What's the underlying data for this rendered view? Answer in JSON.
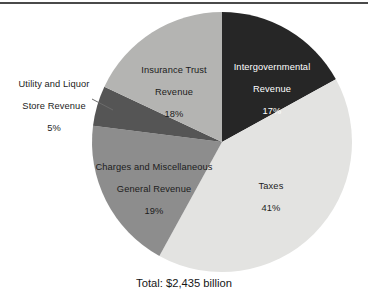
{
  "figure": {
    "caption": "Total: $2,435 billion",
    "top_rule": true
  },
  "chart_data": {
    "type": "pie",
    "title": "",
    "xlabel": "",
    "ylabel": "",
    "legend_position": "none",
    "grid": false,
    "caption": "Total: $2,435 billion",
    "total_label": "Total: $2,435 billion",
    "total_value": 2435,
    "total_units": "billion dollars",
    "start_angle_deg": 0,
    "direction": "clockwise",
    "categories": [
      "Intergovernmental Revenue",
      "Taxes",
      "Charges and Miscellaneous General Revenue",
      "Utility and Liquor Store Revenue",
      "Insurance Trust Revenue"
    ],
    "values": [
      17,
      41,
      19,
      5,
      18
    ],
    "slices": [
      {
        "name": "Intergovernmental Revenue",
        "label_line1": "Intergovernmental",
        "label_line2": "Revenue",
        "percent_text": "17%",
        "value": 17,
        "color": "#262626",
        "text_color": "#ffffff",
        "label_placement": "inside",
        "start_deg": 0,
        "end_deg": 61.2
      },
      {
        "name": "Taxes",
        "label_line1": "Taxes",
        "label_line2": "",
        "percent_text": "41%",
        "value": 41,
        "color": "#e3e3e1",
        "text_color": "#1c1c1c",
        "label_placement": "inside",
        "start_deg": 61.2,
        "end_deg": 208.8
      },
      {
        "name": "Charges and Miscellaneous General Revenue",
        "label_line1": "Charges and Miscellaneous",
        "label_line2": "General Revenue",
        "percent_text": "19%",
        "value": 19,
        "color": "#8d8d8d",
        "text_color": "#1c1c1c",
        "label_placement": "inside",
        "start_deg": 208.8,
        "end_deg": 277.2
      },
      {
        "name": "Utility and Liquor Store Revenue",
        "label_line1": "Utility and Liquor",
        "label_line2": "Store Revenue",
        "percent_text": "5%",
        "value": 5,
        "color": "#555555",
        "text_color": "#1c1c1c",
        "label_placement": "outside",
        "start_deg": 277.2,
        "end_deg": 295.2
      },
      {
        "name": "Insurance Trust Revenue",
        "label_line1": "Insurance Trust",
        "label_line2": "Revenue",
        "percent_text": "18%",
        "value": 18,
        "color": "#b4b4b2",
        "text_color": "#1c1c1c",
        "label_placement": "inside",
        "start_deg": 295.2,
        "end_deg": 360
      }
    ]
  }
}
